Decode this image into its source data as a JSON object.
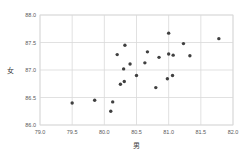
{
  "colors": {
    "background": "#ffffff",
    "grid": "#d9d9d9",
    "point": "#404040",
    "tick_text": "#595959",
    "axis_label_text": "#404040"
  },
  "chart_data": {
    "type": "scatter",
    "title": "",
    "xlabel": "男",
    "ylabel": "女",
    "xlim": [
      79.0,
      82.0
    ],
    "ylim": [
      86.0,
      88.0
    ],
    "grid": true,
    "legend": "none",
    "x_ticks": [
      79.0,
      79.5,
      80.0,
      80.5,
      81.0,
      81.5,
      82.0
    ],
    "x_tick_labels": [
      "79.0",
      "79.5",
      "80.0",
      "80.5",
      "81.0",
      "81.5",
      "82.0"
    ],
    "y_ticks": [
      86.0,
      86.5,
      87.0,
      87.5,
      88.0
    ],
    "y_tick_labels": [
      "86.0",
      "86.5",
      "87.0",
      "87.5",
      "88.0"
    ],
    "points": [
      [
        79.5,
        86.4
      ],
      [
        79.85,
        86.45
      ],
      [
        80.1,
        86.25
      ],
      [
        80.13,
        86.42
      ],
      [
        80.2,
        87.28
      ],
      [
        80.25,
        86.74
      ],
      [
        80.31,
        86.79
      ],
      [
        80.3,
        87.02
      ],
      [
        80.32,
        87.45
      ],
      [
        80.4,
        87.11
      ],
      [
        80.5,
        86.9
      ],
      [
        80.63,
        87.13
      ],
      [
        80.67,
        87.33
      ],
      [
        80.8,
        86.68
      ],
      [
        80.85,
        87.23
      ],
      [
        80.98,
        86.84
      ],
      [
        81.06,
        86.9
      ],
      [
        81.0,
        87.67
      ],
      [
        81.0,
        87.29
      ],
      [
        81.07,
        87.27
      ],
      [
        81.23,
        87.48
      ],
      [
        81.33,
        87.26
      ],
      [
        81.78,
        87.57
      ]
    ]
  }
}
